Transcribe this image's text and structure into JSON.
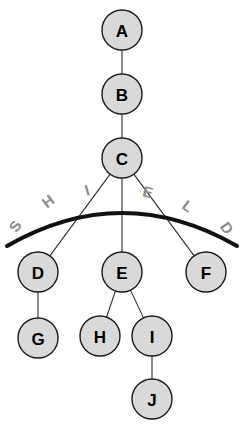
{
  "diagram": {
    "background_color": "#ffffff",
    "node_fill": "#d9d9d9",
    "node_stroke": "#1a1a1a",
    "arc_color": "#111111",
    "arc_label_color": "#8a8a8a",
    "nodes": [
      {
        "id": "A",
        "label": "A",
        "cx": 122,
        "cy": 30,
        "r": 20
      },
      {
        "id": "B",
        "label": "B",
        "cx": 122,
        "cy": 94,
        "r": 20
      },
      {
        "id": "C",
        "label": "C",
        "cx": 122,
        "cy": 158,
        "r": 20
      },
      {
        "id": "D",
        "label": "D",
        "cx": 38,
        "cy": 272,
        "r": 20
      },
      {
        "id": "E",
        "label": "E",
        "cx": 122,
        "cy": 272,
        "r": 20
      },
      {
        "id": "F",
        "label": "F",
        "cx": 206,
        "cy": 272,
        "r": 20
      },
      {
        "id": "G",
        "label": "G",
        "cx": 38,
        "cy": 338,
        "r": 20
      },
      {
        "id": "H",
        "label": "H",
        "cx": 100,
        "cy": 336,
        "r": 20
      },
      {
        "id": "I",
        "label": "I",
        "cx": 152,
        "cy": 336,
        "r": 20
      },
      {
        "id": "J",
        "label": "J",
        "cx": 152,
        "cy": 399,
        "r": 20
      }
    ],
    "edges": [
      {
        "from": "A",
        "to": "B"
      },
      {
        "from": "B",
        "to": "C"
      },
      {
        "from": "C",
        "to": "D"
      },
      {
        "from": "C",
        "to": "E"
      },
      {
        "from": "C",
        "to": "F"
      },
      {
        "from": "D",
        "to": "G"
      },
      {
        "from": "E",
        "to": "H"
      },
      {
        "from": "E",
        "to": "I"
      },
      {
        "from": "I",
        "to": "J"
      }
    ],
    "arc": {
      "label": "SHIELD",
      "path": "M 7 246 Q 122 180 237 246",
      "letters": [
        {
          "char": "S",
          "x": 15,
          "y": 226,
          "rotate": -56
        },
        {
          "char": "H",
          "x": 48,
          "y": 201,
          "rotate": -38
        },
        {
          "char": "I",
          "x": 87,
          "y": 190,
          "rotate": -16
        },
        {
          "char": "E",
          "x": 148,
          "y": 192,
          "rotate": 14
        },
        {
          "char": "L",
          "x": 188,
          "y": 206,
          "rotate": 36
        },
        {
          "char": "D",
          "x": 227,
          "y": 228,
          "rotate": 56
        }
      ]
    }
  }
}
